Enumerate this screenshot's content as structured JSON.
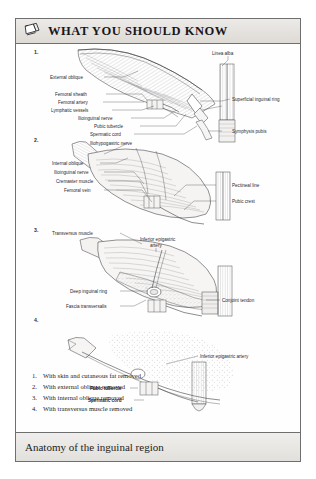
{
  "header": {
    "icon": "book-page-icon",
    "title": "WHAT YOU SHOULD KNOW"
  },
  "caption": {
    "text": "Anatomy of the inguinal region"
  },
  "figure": {
    "panel_numbers": [
      "1.",
      "2.",
      "3.",
      "4."
    ],
    "panels": [
      {
        "number": "1.",
        "labels": [
          "External oblique",
          "Femoral sheath",
          "Femoral artery",
          "Lymphatic vessels",
          "Ilioinguinal nerve",
          "Pubic tubercle",
          "Spermatic cord",
          "Linea alba",
          "Superficial inguinal ring",
          "Symphysis pubis"
        ]
      },
      {
        "number": "2.",
        "labels": [
          "Iliohypogastric nerve",
          "Internal oblique",
          "Ilioinguinal nerve",
          "Cremaster muscle",
          "Femoral vein",
          "Pectineal line",
          "Pubic crest"
        ]
      },
      {
        "number": "3.",
        "labels": [
          "Transversus muscle",
          "Inferior epigastric artery",
          "Deep inguinal ring",
          "Fascia transversalis",
          "Conjoint tendon"
        ]
      },
      {
        "number": "4.",
        "labels": [
          "Inferior epigastric artery",
          "Pubic tubercle",
          "Spermatic cord"
        ]
      }
    ],
    "key": {
      "items": [
        {
          "num": "1.",
          "text": "With skin and cutaneous fat removed"
        },
        {
          "num": "2.",
          "text": "With external oblique removed"
        },
        {
          "num": "3.",
          "text": "With internal oblique removed"
        },
        {
          "num": "4.",
          "text": "With transversus muscle removed"
        }
      ]
    }
  },
  "colors": {
    "page_background": "#ffffff",
    "card_border": "#6f6f6f",
    "header_background": "#e4e1dd",
    "caption_background": "#e9e7e3",
    "text": "#1d1d22",
    "line_art": "#4a4a4e"
  }
}
